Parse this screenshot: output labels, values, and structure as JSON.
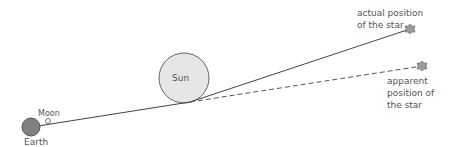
{
  "diagram": {
    "labels": {
      "sun": "Sun",
      "moon": "Moon",
      "earth": "Earth",
      "actual_line1": "actual position",
      "actual_line2": "of the star",
      "apparent_line1": "apparent",
      "apparent_line2": "position of",
      "apparent_line3": "the star"
    },
    "colors": {
      "earth_fill": "#808080",
      "sun_fill": "#e6e6e6",
      "star_fill": "#9a9a9a",
      "line": "#444444",
      "text": "#555555"
    }
  }
}
